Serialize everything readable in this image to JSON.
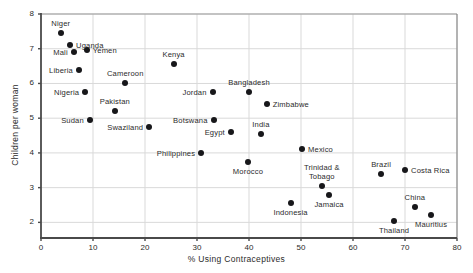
{
  "chart_data": {
    "type": "scatter",
    "title": "",
    "xlabel": "% Using Contraceptives",
    "ylabel": "Children per woman",
    "xlim": [
      0,
      80
    ],
    "ylim": [
      1.55,
      8
    ],
    "xticks": [
      0,
      10,
      20,
      30,
      40,
      50,
      60,
      70,
      80
    ],
    "yticks": [
      2,
      3,
      4,
      5,
      6,
      7,
      8
    ],
    "grid": "horizontal-and-vertical-light",
    "legend": "none",
    "points": [
      {
        "name": "Niger",
        "x": 3.8,
        "y": 7.45,
        "label_pos": "above"
      },
      {
        "name": "Uganda",
        "x": 5.6,
        "y": 7.1,
        "label_pos": "right"
      },
      {
        "name": "Mali",
        "x": 6.3,
        "y": 6.9,
        "label_pos": "left"
      },
      {
        "name": "Yemen",
        "x": 8.8,
        "y": 6.95,
        "label_pos": "right"
      },
      {
        "name": "Liberia",
        "x": 7.3,
        "y": 6.4,
        "label_pos": "left"
      },
      {
        "name": "Nigeria",
        "x": 8.5,
        "y": 5.75,
        "label_pos": "left"
      },
      {
        "name": "Sudan",
        "x": 9.4,
        "y": 4.95,
        "label_pos": "left"
      },
      {
        "name": "Pakistan",
        "x": 14.2,
        "y": 5.2,
        "label_pos": "above"
      },
      {
        "name": "Cameroon",
        "x": 16.2,
        "y": 6.0,
        "label_pos": "above"
      },
      {
        "name": "Swaziland",
        "x": 20.8,
        "y": 4.75,
        "label_pos": "left"
      },
      {
        "name": "Kenya",
        "x": 25.5,
        "y": 6.55,
        "label_pos": "above"
      },
      {
        "name": "Philippines",
        "x": 30.8,
        "y": 4.0,
        "label_pos": "left"
      },
      {
        "name": "Jordan",
        "x": 33.0,
        "y": 5.75,
        "label_pos": "left"
      },
      {
        "name": "Botswana",
        "x": 33.2,
        "y": 4.95,
        "label_pos": "left"
      },
      {
        "name": "Egypt",
        "x": 36.5,
        "y": 4.6,
        "label_pos": "left"
      },
      {
        "name": "Morocco",
        "x": 39.8,
        "y": 3.75,
        "label_pos": "below"
      },
      {
        "name": "Bangladesh",
        "x": 40.0,
        "y": 5.75,
        "label_pos": "above"
      },
      {
        "name": "India",
        "x": 42.3,
        "y": 4.55,
        "label_pos": "above"
      },
      {
        "name": "Zimbabwe",
        "x": 43.4,
        "y": 5.4,
        "label_pos": "right"
      },
      {
        "name": "Indonesia",
        "x": 48.0,
        "y": 2.55,
        "label_pos": "below"
      },
      {
        "name": "Mexico",
        "x": 50.2,
        "y": 4.1,
        "label_pos": "right"
      },
      {
        "name": "Trinidad &\nTobago",
        "x": 54.0,
        "y": 3.05,
        "label_pos": "above"
      },
      {
        "name": "Jamaica",
        "x": 55.4,
        "y": 2.8,
        "label_pos": "below"
      },
      {
        "name": "Brazil",
        "x": 65.4,
        "y": 3.4,
        "label_pos": "above"
      },
      {
        "name": "Thailand",
        "x": 67.9,
        "y": 2.05,
        "label_pos": "below"
      },
      {
        "name": "Costa Rica",
        "x": 70.0,
        "y": 3.5,
        "label_pos": "right"
      },
      {
        "name": "China",
        "x": 71.9,
        "y": 2.45,
        "label_pos": "above"
      },
      {
        "name": "Mauritius",
        "x": 75.0,
        "y": 2.2,
        "label_pos": "below"
      }
    ]
  },
  "colors": {
    "point": "#17171a",
    "axis": "#4a4a4a",
    "grid": "#d9d9d9",
    "text": "#2b2b2b",
    "background": "#ffffff"
  }
}
